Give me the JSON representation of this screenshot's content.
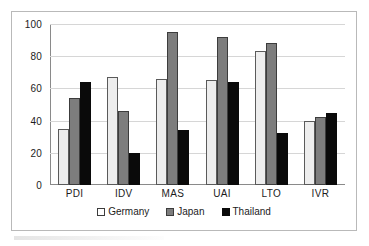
{
  "chart_data": {
    "type": "bar",
    "title": "",
    "subtitle": "",
    "xlabel": "",
    "ylabel": "",
    "categories": [
      "PDI",
      "IDV",
      "MAS",
      "UAI",
      "LTO",
      "IVR"
    ],
    "series": [
      {
        "name": "Germany",
        "color": "#ededed",
        "values": [
          35,
          67,
          66,
          65,
          83,
          40
        ]
      },
      {
        "name": "Japan",
        "color": "#7d7d7d",
        "values": [
          54,
          46,
          95,
          92,
          88,
          42
        ]
      },
      {
        "name": "Thailand",
        "color": "#0a0a0a",
        "values": [
          64,
          20,
          34,
          64,
          32,
          45
        ]
      }
    ],
    "ylim": [
      0,
      100
    ],
    "yticks": [
      0,
      20,
      40,
      60,
      80,
      100
    ],
    "ytick_labels": [
      "0",
      "20",
      "40",
      "60",
      "80",
      "100"
    ],
    "grid": true,
    "grid_axis": "y",
    "legend_position": "bottom",
    "legend_entries": [
      "Germany",
      "Japan",
      "Thailand"
    ],
    "annotations": []
  },
  "colors": {
    "frame_border": "#b9b9b9",
    "gridline": "#d6d6d6",
    "axis": "#8a8a8a",
    "text": "#1c1c1c",
    "background": "#ffffff"
  }
}
